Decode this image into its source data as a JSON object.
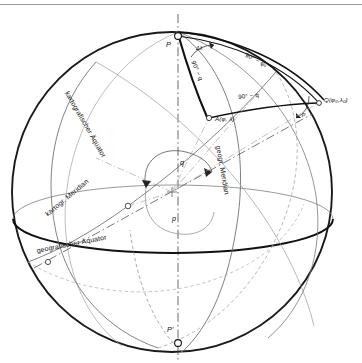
{
  "figure": {
    "kind": "sphere-coordinate-diagram",
    "language": "de",
    "top_rule": true,
    "background_color": "#ffffff",
    "line_color": "#1a1a1a",
    "thin_line_color": "#555555",
    "sphere": {
      "center_x": 172,
      "center_y": 192,
      "radius": 160,
      "outline_stroke_width": 1.9
    }
  },
  "points": {
    "north_pole": "P",
    "south_pole": "P'",
    "point_a": "A(φ, λ)",
    "point_q": "Q(φ₀,λ₀)"
  },
  "angles": {
    "delta_lambda": "Δλ",
    "colatitude_phi0": "90° − φ₀",
    "colatitude_q_inner": "90° − q",
    "colatitude_q_outer": "90° − q",
    "rotation_q": "q",
    "rotation_p": "p",
    "vertex_angle_p": "p"
  },
  "curve_labels": {
    "kartografischer_aequator": "kartografischer Äquator",
    "kartogr_meridian": "kartogr. Meridian",
    "geografischer_aequator": "geografischer Äquator",
    "geogr_meridian": "geogr. Meridian"
  }
}
